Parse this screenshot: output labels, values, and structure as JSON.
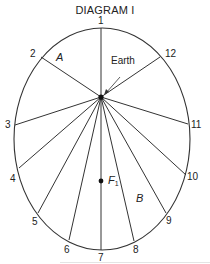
{
  "title": "DIAGRAM I",
  "ellipse": {
    "cx": 102,
    "cy": 139,
    "rx": 88,
    "ry": 111,
    "stroke": "#333333"
  },
  "focus_earth": {
    "x": 101,
    "y": 97
  },
  "focus_f1": {
    "x": 101,
    "y": 181,
    "label": "F",
    "subscript": "1"
  },
  "region_labels": {
    "a": "A",
    "b": "B"
  },
  "earth_label": "Earth",
  "orbit_points": [
    {
      "n": "1",
      "x": 101,
      "y": 28
    },
    {
      "n": "2",
      "x": 41,
      "y": 57
    },
    {
      "n": "3",
      "x": 15,
      "y": 125
    },
    {
      "n": "4",
      "x": 19,
      "y": 168
    },
    {
      "n": "5",
      "x": 38,
      "y": 213
    },
    {
      "n": "6",
      "x": 69,
      "y": 240
    },
    {
      "n": "7",
      "x": 101,
      "y": 249
    },
    {
      "n": "8",
      "x": 134,
      "y": 241
    },
    {
      "n": "9",
      "x": 166,
      "y": 213
    },
    {
      "n": "10",
      "x": 186,
      "y": 175
    },
    {
      "n": "11",
      "x": 188,
      "y": 124
    },
    {
      "n": "12",
      "x": 160,
      "y": 57
    }
  ]
}
